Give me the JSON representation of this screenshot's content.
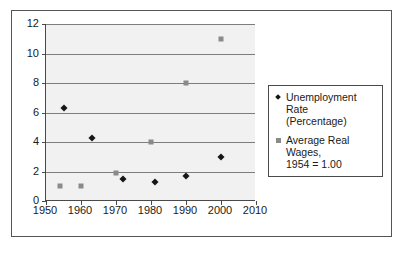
{
  "chart_data": {
    "type": "scatter",
    "title": "",
    "xlabel": "",
    "ylabel": "",
    "xlim": [
      1950,
      2010
    ],
    "ylim": [
      0,
      12
    ],
    "xticks": [
      1950,
      1960,
      1970,
      1980,
      1990,
      2000,
      2010
    ],
    "yticks": [
      0,
      2,
      4,
      6,
      8,
      10,
      12
    ],
    "grid": "horizontal",
    "legend_position": "right",
    "plot_background": "#f1f1f1",
    "gridline_color": "#7d7d7d",
    "axis_color": "#4a4a4a",
    "series": [
      {
        "name": "Unemployment Rate (Percentage)",
        "marker": "diamond",
        "color": "#151515",
        "points": [
          {
            "x": 1955,
            "y": 6.3
          },
          {
            "x": 1963,
            "y": 4.3
          },
          {
            "x": 1972,
            "y": 1.5
          },
          {
            "x": 1981,
            "y": 1.3
          },
          {
            "x": 1990,
            "y": 1.7
          },
          {
            "x": 2000,
            "y": 3.0
          }
        ]
      },
      {
        "name": "Average Real Wages, 1954 = 1.00",
        "marker": "square",
        "color": "#8a8a8a",
        "points": [
          {
            "x": 1954,
            "y": 1.0
          },
          {
            "x": 1960,
            "y": 1.0
          },
          {
            "x": 1970,
            "y": 1.9
          },
          {
            "x": 1980,
            "y": 4.0
          },
          {
            "x": 1990,
            "y": 8.0
          },
          {
            "x": 2000,
            "y": 11.0
          }
        ]
      }
    ]
  },
  "legend": {
    "entries": [
      {
        "label": "Unemployment Rate\n(Percentage)",
        "marker": "diamond"
      },
      {
        "label": "Average Real Wages,\n1954 = 1.00",
        "marker": "square"
      }
    ]
  }
}
